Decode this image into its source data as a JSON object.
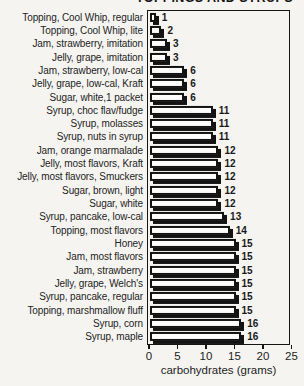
{
  "title_clipped_text": "TOPPINGS AND SYRUPS",
  "chart_data": {
    "type": "bar",
    "orientation": "horizontal",
    "xlabel": "carbohydrates (grams)",
    "xlim": [
      0,
      25
    ],
    "xticks": [
      0,
      5,
      10,
      15,
      20,
      25
    ],
    "grid": false,
    "legend": "none",
    "bar_fill_color": "#fdfdfc",
    "bar_border_color": "#131313",
    "bar_shadow_color": "#131313",
    "categories": [
      "Topping, Cool Whip, regular",
      "Topping, Cool Whip, lite",
      "Jam, strawberry, imitation",
      "Jelly, grape, imitation",
      "Jam, strawberry, low-cal",
      "Jelly, grape, low-cal, Kraft",
      "Sugar, white,1 packet",
      "Syrup, choc flav/fudge",
      "Syrup, molasses",
      "Syrup, nuts in syrup",
      "Jam, orange marmalade",
      "Jelly, most flavors, Kraft",
      "Jelly, most flavors, Smuckers",
      "Sugar, brown, light",
      "Sugar, white",
      "Syrup, pancake, low-cal",
      "Topping, most flavors",
      "Honey",
      "Jam, most flavors",
      "Jam, strawberry",
      "Jelly, grape, Welch's",
      "Syrup, pancake, regular",
      "Topping, marshmallow fluff",
      "Syrup, corn",
      "Syrup, maple"
    ],
    "values": [
      1,
      2,
      3,
      3,
      6,
      6,
      6,
      11,
      11,
      11,
      12,
      12,
      12,
      12,
      12,
      13,
      14,
      15,
      15,
      15,
      15,
      15,
      15,
      16,
      16
    ]
  }
}
